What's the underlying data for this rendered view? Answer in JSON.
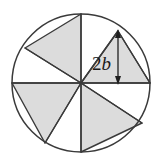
{
  "figure": {
    "dimension_label": {
      "coefficient": "2",
      "variable": "b",
      "full_text": "2b"
    },
    "colors": {
      "shading": "#dcdcdc",
      "outline": "#3a3a3a",
      "arrow": "#1f1f1f",
      "background": "#ffffff",
      "label_text": "#1a1a1a"
    },
    "geometry": {
      "center": {
        "x": 81,
        "y": 83
      },
      "radius": 69,
      "sector_count": 8,
      "shaded_sector_count": 4,
      "spoke_angles_deg": [
        0,
        45,
        90,
        135,
        180,
        225,
        270,
        315
      ],
      "shaded_triangles": [
        {
          "name": "upper-right-shaded-triangle",
          "points": "81,83 118,31 150,83"
        },
        {
          "name": "upper-left-shaded-triangle",
          "points": "81,83 81,14 25,48"
        },
        {
          "name": "lower-left-shaded-triangle",
          "points": "81,83 12,83 45,143"
        },
        {
          "name": "lower-right-shaded-triangle",
          "points": "81,83 81,152 142,123"
        }
      ],
      "dimension_arrow": {
        "x": 118,
        "y_top": 31,
        "y_bottom": 83,
        "label_x": 92,
        "label_y": 68
      }
    }
  }
}
